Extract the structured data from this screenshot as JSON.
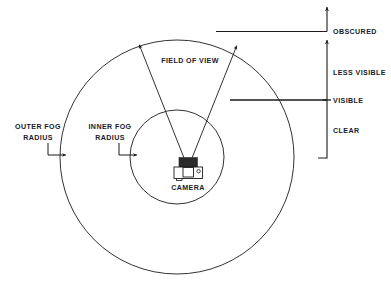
{
  "diagram": {
    "colors": {
      "stroke": "#1b1b1b",
      "text": "#17202c",
      "background": "#ffffff",
      "camera_body_fill": "#ffffff",
      "camera_top_fill": "#2a2a2a"
    },
    "circles": {
      "outer_fog": {
        "cx": 177,
        "cy": 157,
        "r": 117
      },
      "inner_fog": {
        "cx": 177,
        "cy": 157,
        "r": 47
      }
    },
    "field_of_view": {
      "apex_x": 188,
      "apex_y": 168,
      "left_tip_x": 138,
      "left_tip_y": 42,
      "right_tip_x": 238,
      "right_tip_y": 43
    },
    "labels": {
      "outer_fog_radius": "OUTER FOG\nRADIUS",
      "outer_fog_radius_line1": "OUTER FOG",
      "outer_fog_radius_line2": "RADIUS",
      "inner_fog_radius_line1": "INNER FOG",
      "inner_fog_radius_line2": "RADIUS",
      "field_of_view": "FIELD OF VIEW",
      "camera": "CAMERA"
    },
    "legend": {
      "axis_x": 327,
      "items": [
        {
          "key": "obscured",
          "label": "OBSCURED",
          "y": 31
        },
        {
          "key": "less_visible",
          "label": "LESS VISIBLE",
          "y": 72
        },
        {
          "key": "visible",
          "label": "VISIBLE",
          "y": 100
        },
        {
          "key": "clear",
          "label": "CLEAR",
          "y": 130
        }
      ]
    }
  }
}
